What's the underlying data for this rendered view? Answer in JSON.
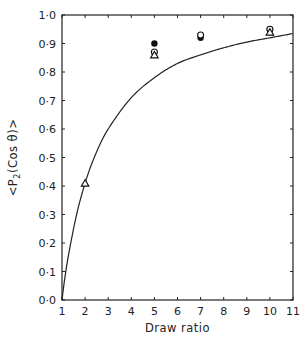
{
  "chart_data": {
    "type": "scatter",
    "title": "",
    "xlabel": "Draw ratio",
    "ylabel": "<P2(Cos θ)>",
    "xlim": [
      1,
      11
    ],
    "ylim": [
      0.0,
      1.0
    ],
    "x_ticks": [
      "1",
      "2",
      "3",
      "4",
      "5",
      "6",
      "7",
      "8",
      "9",
      "10",
      "11"
    ],
    "y_ticks": [
      "0·0",
      "0·1",
      "0·2",
      "0·3",
      "0·4",
      "0·5",
      "0·6",
      "0·7",
      "0·8",
      "0·9",
      "1·0"
    ],
    "grid": false,
    "legend": null,
    "series": [
      {
        "name": "filled circles",
        "marker": "filled-circle",
        "x": [
          5,
          7,
          10
        ],
        "y": [
          0.9,
          0.92,
          0.95
        ]
      },
      {
        "name": "open circles",
        "marker": "open-circle",
        "x": [
          5,
          7,
          10
        ],
        "y": [
          0.87,
          0.93,
          0.95
        ]
      },
      {
        "name": "open triangles",
        "marker": "open-triangle",
        "x": [
          2,
          5,
          10
        ],
        "y": [
          0.41,
          0.86,
          0.94
        ]
      },
      {
        "name": "fitted curve",
        "type": "line",
        "x": [
          1,
          1.5,
          2,
          2.5,
          3,
          4,
          5,
          6,
          7,
          8,
          9,
          10,
          11
        ],
        "y": [
          0.0,
          0.25,
          0.41,
          0.52,
          0.6,
          0.71,
          0.78,
          0.83,
          0.86,
          0.885,
          0.905,
          0.92,
          0.935
        ]
      }
    ]
  },
  "axes": {
    "xlabel": "Draw ratio",
    "ylabel_parts": {
      "pre": "<P",
      "sub": "2",
      "post": "(Cos θ)>"
    }
  }
}
